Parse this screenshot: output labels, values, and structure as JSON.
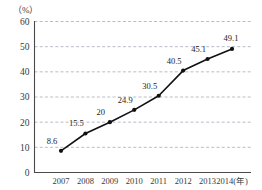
{
  "chart_data": {
    "type": "line",
    "title": "",
    "subtitle": "",
    "xlabel": "(年)",
    "ylabel": "（%）",
    "categories": [
      "2007",
      "2008",
      "2009",
      "2010",
      "2011",
      "2012",
      "2013",
      "2014"
    ],
    "values": [
      8.6,
      15.5,
      20,
      24.9,
      30.5,
      40.5,
      45.1,
      49.1
    ],
    "point_labels": [
      "8.6",
      "15.5",
      "20",
      "24.9",
      "30.5",
      "40.5",
      "45.1",
      "49.1"
    ],
    "ylim": [
      0,
      60
    ],
    "yticks": [
      0,
      10,
      20,
      30,
      40,
      50,
      60
    ],
    "ytick_labels": [
      "0",
      "10",
      "20",
      "30",
      "40",
      "50",
      "60"
    ],
    "xtick_labels": [
      "2007",
      "2008",
      "2009",
      "2010",
      "2011",
      "2012",
      "2013",
      "2014(年)"
    ],
    "grid": true,
    "grid_axis": "y",
    "legend": false,
    "legend_position": "none",
    "series": [
      {
        "name": "",
        "values": [
          8.6,
          15.5,
          20,
          24.9,
          30.5,
          40.5,
          45.1,
          49.1
        ]
      }
    ],
    "colors": {
      "line": "#111111",
      "marker": "#111111",
      "grid": "#9aa0b0",
      "axis": "#4a4a4a",
      "text": "#2b2b2b",
      "background": "#ffffff"
    }
  },
  "axis": {
    "y_unit_label": "（%）",
    "x_unit_label": "(年)"
  }
}
